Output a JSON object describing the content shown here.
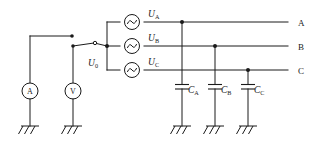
{
  "diagram": {
    "background_color": "#ffffff",
    "line_color": "#1a1a1a"
  },
  "sources": [
    {
      "id": "ua",
      "symbol": "U",
      "subscript": "A",
      "icon": "ac-source-icon",
      "cx": 132,
      "cy": 22
    },
    {
      "id": "ub",
      "symbol": "U",
      "subscript": "B",
      "icon": "ac-source-icon",
      "cx": 132,
      "cy": 46
    },
    {
      "id": "uc",
      "symbol": "U",
      "subscript": "C",
      "icon": "ac-source-icon",
      "cx": 132,
      "cy": 70
    }
  ],
  "source_labels": [
    {
      "base": "U",
      "sub": "A",
      "x": 148,
      "y": 17
    },
    {
      "base": "U",
      "sub": "B",
      "x": 148,
      "y": 41
    },
    {
      "base": "U",
      "sub": "C",
      "x": 148,
      "y": 65
    }
  ],
  "switch": {
    "label_base": "U",
    "label_sub": "0",
    "label_x": 88,
    "label_y": 66,
    "name": "changeover-switch"
  },
  "meters": [
    {
      "id": "ammeter",
      "label": "A",
      "icon": "ammeter-icon",
      "cx": 30,
      "cy": 91
    },
    {
      "id": "voltmeter",
      "label": "V",
      "icon": "voltmeter-icon",
      "cx": 73,
      "cy": 91
    }
  ],
  "capacitors": [
    {
      "id": "ca",
      "base": "C",
      "sub": "A",
      "x": 182,
      "label_x": 188,
      "label_y": 93
    },
    {
      "id": "cb",
      "base": "C",
      "sub": "B",
      "x": 215,
      "label_x": 221,
      "label_y": 93
    },
    {
      "id": "cc",
      "base": "C",
      "sub": "C",
      "x": 248,
      "label_x": 254,
      "label_y": 93
    }
  ],
  "bus_lines": [
    {
      "id": "bus-a",
      "label": "A",
      "y": 22,
      "label_x": 298,
      "label_y": 26
    },
    {
      "id": "bus-b",
      "label": "B",
      "y": 46,
      "label_x": 298,
      "label_y": 50
    },
    {
      "id": "bus-c",
      "label": "C",
      "y": 70,
      "label_x": 298,
      "label_y": 74
    }
  ],
  "grounds": [
    {
      "id": "gnd-ammeter",
      "x": 30,
      "y": 126
    },
    {
      "id": "gnd-voltmeter",
      "x": 73,
      "y": 126
    },
    {
      "id": "gnd-ca",
      "x": 182,
      "y": 126
    },
    {
      "id": "gnd-cb",
      "x": 215,
      "y": 126
    },
    {
      "id": "gnd-cc",
      "x": 248,
      "y": 126
    }
  ]
}
